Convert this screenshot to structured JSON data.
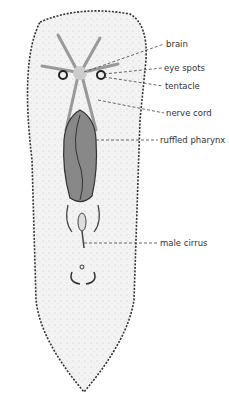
{
  "diagram": {
    "labels": [
      {
        "id": "brain",
        "text": "brain",
        "x": 166,
        "y": 40
      },
      {
        "id": "eye-spots",
        "text": "eye spots",
        "x": 164,
        "y": 64
      },
      {
        "id": "tentacle",
        "text": "tentacle",
        "x": 165,
        "y": 82
      },
      {
        "id": "nerve-cord",
        "text": "nerve cord",
        "x": 166,
        "y": 109
      },
      {
        "id": "ruffled-pharynx",
        "text": "ruffled pharynx",
        "x": 160,
        "y": 136
      },
      {
        "id": "male-cirrus",
        "text": "male cirrus",
        "x": 160,
        "y": 239
      }
    ],
    "colors": {
      "outline": "#333333",
      "stipple": "#b8b8b8",
      "pharynx": "#555555",
      "text": "#333333"
    }
  }
}
